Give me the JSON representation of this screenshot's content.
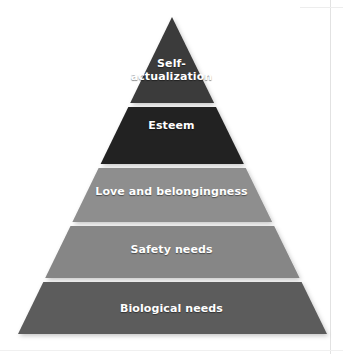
{
  "diagram": {
    "type": "pyramid",
    "name": "maslow-hierarchy-of-needs",
    "background_color": "#ffffff",
    "label_color": "#ffffff",
    "separator_color": "#f2f0ec",
    "apex": {
      "x": 172,
      "y": 17
    },
    "base_left": {
      "x": 18,
      "y": 334
    },
    "base_right": {
      "x": 327,
      "y": 334
    },
    "tiers": [
      {
        "id": "self-actualization",
        "label": "Self-\nactualization",
        "label_plain": "Self-actualization",
        "rank": 5,
        "color": "#3a3a3a",
        "top_y": 17,
        "bottom_y": 103
      },
      {
        "id": "esteem",
        "label": "Esteem",
        "label_plain": "Esteem",
        "rank": 4,
        "color": "#232323",
        "top_y": 107,
        "bottom_y": 164
      },
      {
        "id": "love-and-belongingness",
        "label": "Love and belongingness",
        "label_plain": "Love and belongingness",
        "rank": 3,
        "color": "#8e8e8e",
        "top_y": 168,
        "bottom_y": 222
      },
      {
        "id": "safety-needs",
        "label": "Safety needs",
        "label_plain": "Safety needs",
        "rank": 2,
        "color": "#868686",
        "top_y": 226,
        "bottom_y": 278
      },
      {
        "id": "biological-needs",
        "label": "Biological needs",
        "label_plain": "Biological needs",
        "rank": 1,
        "color": "#5c5c5c",
        "top_y": 282,
        "bottom_y": 334
      }
    ]
  }
}
